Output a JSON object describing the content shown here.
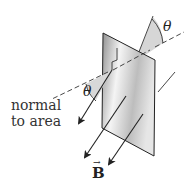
{
  "figure": {
    "labels": {
      "normal_line1": "normal",
      "normal_line2": "to area",
      "theta_top": "θ",
      "theta_left": "θ",
      "field": "B",
      "field_vector_arrow": "→"
    },
    "colors": {
      "plane_light": "#f2f2f2",
      "plane_dark": "#9a9a9a",
      "wedge": "#d8d8d8",
      "line": "#222222"
    }
  }
}
